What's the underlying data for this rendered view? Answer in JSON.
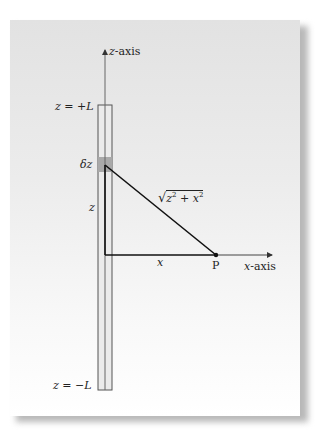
{
  "diagram": {
    "type": "line-charge-geometry",
    "labels": {
      "z_axis": "z-axis",
      "x_axis": "x-axis",
      "z_top": "z = +L",
      "z_bottom": "z = −L",
      "delta_z": "δz",
      "z": "z",
      "x": "x",
      "hypotenuse": "√(z² + x²)",
      "hyp_radicand_a": "z",
      "hyp_exp_a": "2",
      "hyp_plus": " + ",
      "hyp_radicand_b": "x",
      "hyp_exp_b": "2",
      "point": "P"
    },
    "colors": {
      "panel_top": "#e2e2e2",
      "panel_bottom": "#ffffff",
      "rod_fill": "#ebebeb",
      "rod_stroke": "#555555",
      "delta_fill": "#a9a9a9",
      "line": "#111111",
      "axis_gray": "#666666"
    },
    "geometry": {
      "rod": {
        "x": 98,
        "y_top": 105,
        "width": 14,
        "y_bottom": 390
      },
      "z_axis_x": 105,
      "z_axis_arrow_tip_y": 47,
      "delta_block": {
        "y": 157,
        "height": 15
      },
      "element_point": {
        "x": 105,
        "y": 165
      },
      "origin": {
        "x": 105,
        "y": 255
      },
      "P": {
        "x": 216,
        "y": 255
      },
      "x_axis_arrow_tip_x": 275
    }
  }
}
